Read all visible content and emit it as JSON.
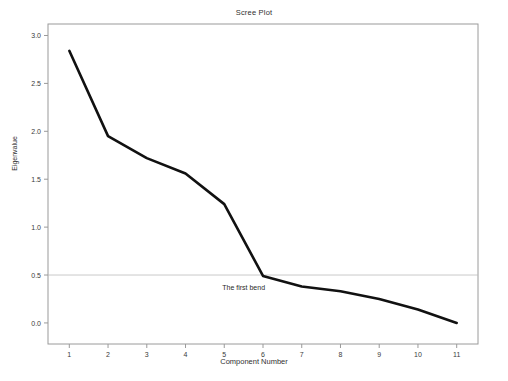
{
  "chart_data": {
    "type": "line",
    "title": "Scree Plot",
    "xlabel": "Component Number",
    "ylabel": "Eigenvalue",
    "x": [
      1,
      2,
      3,
      4,
      5,
      6,
      7,
      8,
      9,
      10,
      11
    ],
    "values": [
      2.84,
      1.95,
      1.72,
      1.56,
      1.24,
      0.49,
      0.38,
      0.33,
      0.25,
      0.14,
      0.0
    ],
    "series": [
      {
        "name": "Eigenvalue",
        "values": [
          2.84,
          1.95,
          1.72,
          1.56,
          1.24,
          0.49,
          0.38,
          0.33,
          0.25,
          0.14,
          0.0
        ]
      }
    ],
    "xtick_labels": [
      "1",
      "2",
      "3",
      "4",
      "5",
      "6",
      "7",
      "8",
      "9",
      "10",
      "11"
    ],
    "ytick_labels": [
      "0.0",
      "0.5",
      "1.0",
      "1.5",
      "2.0",
      "2.5",
      "3.0"
    ],
    "ytick_values": [
      0.0,
      0.5,
      1.0,
      1.5,
      2.0,
      2.5,
      3.0
    ],
    "xlim": [
      0.45,
      11.55
    ],
    "ylim": [
      -0.22,
      3.12
    ],
    "grid": false,
    "legend": "none",
    "line_color": "#111111",
    "line_width": 2.6,
    "frame_color": "#9a9a9a",
    "reference_line": {
      "axis": "y",
      "value": 0.5,
      "color": "#bdbdbd",
      "width": 0.8
    },
    "annotations": [
      {
        "text": "The first bend",
        "x": 5.5,
        "y": 0.34
      }
    ]
  }
}
